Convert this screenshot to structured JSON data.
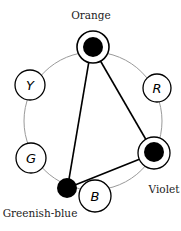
{
  "diagram": {
    "labels": {
      "orange": "Orange",
      "violet": "Violet",
      "greenish_blue": "Greenish-blue"
    },
    "nodes": {
      "r": "R",
      "y": "Y",
      "g": "G",
      "b": "B"
    },
    "colors": {
      "stroke": "#000000",
      "ring": "#999999",
      "background": "#ffffff"
    }
  }
}
